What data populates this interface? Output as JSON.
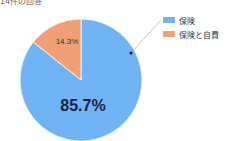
{
  "header": {
    "subtitle": "14件の回答"
  },
  "chart_data": {
    "type": "pie",
    "subtitle": "14件の回答",
    "categories": [
      "保険",
      "保険と自費"
    ],
    "values": [
      85.7,
      14.3
    ],
    "counts": [
      12,
      2
    ],
    "colors": [
      "#70b4f5",
      "#f0a074"
    ],
    "labels": [
      "85.7%",
      "14.3%"
    ],
    "legend_position": "right"
  },
  "legend": {
    "items": [
      {
        "label": "保険",
        "color": "#70b4f5"
      },
      {
        "label": "保険と自費",
        "color": "#f0a074"
      }
    ]
  }
}
